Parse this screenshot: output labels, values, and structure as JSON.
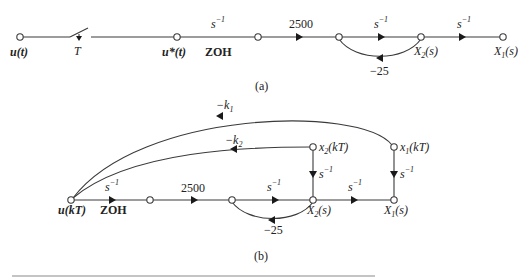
{
  "diagram_a": {
    "caption": "(a)",
    "nodes": {
      "u_t": "u(t)",
      "switch_T": "T",
      "u_star": "u*(t)",
      "zoh": "ZOH",
      "x2": "X",
      "x2_sub": "2",
      "x2_arg": "(s)",
      "x1": "X",
      "x1_sub": "1",
      "x1_arg": "(s)"
    },
    "gains": {
      "zoh_gain_base": "s",
      "zoh_gain_exp": "−1",
      "gain_2500": "2500",
      "int1_base": "s",
      "int1_exp": "−1",
      "feedback": "−25",
      "int2_base": "s",
      "int2_exp": "−1"
    }
  },
  "diagram_b": {
    "caption": "(b)",
    "nodes": {
      "u_kT": "u(kT)",
      "zoh": "ZOH",
      "x2": "X",
      "x2_sub": "2",
      "x2_arg": "(s)",
      "x1": "X",
      "x1_sub": "1",
      "x1_arg": "(s)",
      "x2_kT": "x",
      "x2_kT_sub": "2",
      "x2_kT_arg": "(kT)",
      "x1_kT": "x",
      "x1_kT_sub": "1",
      "x1_kT_arg": "(kT)"
    },
    "gains": {
      "k1_base": "−k",
      "k1_sub": "1",
      "k2_base": "−k",
      "k2_sub": "2",
      "zoh_gain_base": "s",
      "zoh_gain_exp": "−1",
      "gain_2500": "2500",
      "int1_base": "s",
      "int1_exp": "−1",
      "feedback": "−25",
      "int2_base": "s",
      "int2_exp": "−1",
      "x2_delay_base": "s",
      "x2_delay_exp": "−1",
      "x1_delay_base": "s",
      "x1_delay_exp": "−1"
    }
  }
}
